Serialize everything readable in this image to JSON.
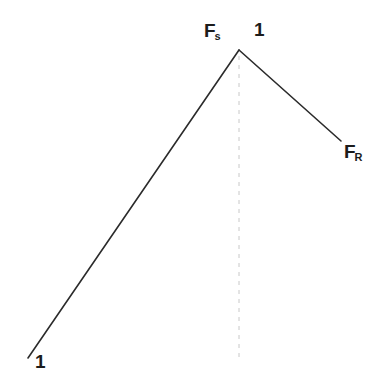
{
  "figure": {
    "background_color": "#ffffff",
    "line_color": "#2b2b2b",
    "dashed_line_color": "#c8c8c8",
    "labels": {
      "peak_left": {
        "base": "F",
        "sub": "s",
        "full": "Fs"
      },
      "peak_value": "1",
      "right_end": {
        "base": "F",
        "sub": "R",
        "full": "FR"
      },
      "origin_value": "1"
    }
  },
  "chart_data": {
    "type": "line",
    "title": "",
    "xlabel": "",
    "ylabel": "",
    "grid": false,
    "legend": false,
    "axis_visible": false,
    "xlim": [
      0,
      377
    ],
    "ylim": [
      392,
      0
    ],
    "annotations": [
      {
        "text": "Fs",
        "x": 204,
        "y": 30,
        "role": "peak-left-label"
      },
      {
        "text": "1",
        "x": 258,
        "y": 30,
        "role": "peak-value-label"
      },
      {
        "text": "FR",
        "x": 350,
        "y": 152,
        "role": "right-endpoint-label"
      },
      {
        "text": "1",
        "x": 40,
        "y": 362,
        "role": "origin-value-label"
      }
    ],
    "series": [
      {
        "name": "rising-segment",
        "style": "solid",
        "color": "#2b2b2b",
        "width": 1.6,
        "points": [
          [
            28,
            358
          ],
          [
            239,
            50
          ]
        ]
      },
      {
        "name": "falling-segment",
        "style": "solid",
        "color": "#2b2b2b",
        "width": 1.6,
        "points": [
          [
            239,
            50
          ],
          [
            341,
            141
          ]
        ]
      },
      {
        "name": "peak-drop-line",
        "style": "dashed",
        "color": "#c8c8c8",
        "width": 1,
        "points": [
          [
            239,
            56
          ],
          [
            239,
            362
          ]
        ]
      }
    ]
  }
}
